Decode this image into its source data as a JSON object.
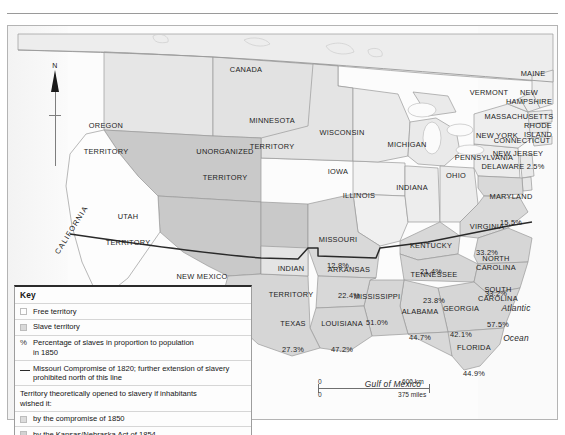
{
  "map": {
    "title": "Slave and free territories of the United States, 1850",
    "frame_color": "#b4b4b4",
    "background": "#fbfbfb",
    "north_arrow_label": "N",
    "colors": {
      "free_territory": "#fefefe",
      "slave_territory": "#d9d9d9",
      "unorganized": "#dedede",
      "compromise_1850": "#c9c9c9",
      "kansas_nebraska": "#d2d2d2",
      "water": "#f4f4f4",
      "compromise_line": "#2a2a2a",
      "border": "#9a9a9a"
    }
  },
  "oceans": [
    {
      "name": "Pacific Ocean",
      "line1": "Pacific",
      "line2": "Ocean"
    },
    {
      "name": "Atlantic Ocean",
      "line1": "Atlantic",
      "line2": "Ocean"
    },
    {
      "name": "Gulf of Mexico",
      "line1": "Gulf of Mexico",
      "line2": ""
    }
  ],
  "foreign": [
    {
      "name": "Canada",
      "label": "CANADA"
    }
  ],
  "territories": [
    {
      "name": "Oregon Territory",
      "line1": "OREGON",
      "line2": "TERRITORY"
    },
    {
      "name": "Utah Territory",
      "line1": "UTAH",
      "line2": "TERRITORY"
    },
    {
      "name": "New Mexico Territory",
      "line1": "NEW MEXICO",
      "line2": "TERRITORY"
    },
    {
      "name": "Unorganized Territory",
      "line1": "UNORGANIZED",
      "line2": "TERRITORY"
    },
    {
      "name": "Minnesota Territory",
      "line1": "MINNESOTA",
      "line2": "TERRITORY"
    },
    {
      "name": "Indian Territory",
      "line1": "INDIAN",
      "line2": "TERRITORY"
    }
  ],
  "states": [
    {
      "name": "California",
      "label": "CALIFORNIA",
      "pct": ""
    },
    {
      "name": "Wisconsin",
      "label": "WISCONSIN",
      "pct": ""
    },
    {
      "name": "Iowa",
      "label": "IOWA",
      "pct": ""
    },
    {
      "name": "Illinois",
      "label": "ILLINOIS",
      "pct": ""
    },
    {
      "name": "Michigan",
      "label": "MICHIGAN",
      "pct": ""
    },
    {
      "name": "Indiana",
      "label": "INDIANA",
      "pct": ""
    },
    {
      "name": "Ohio",
      "label": "OHIO",
      "pct": ""
    },
    {
      "name": "Pennsylvania",
      "label": "PENNSYLVANIA",
      "pct": ""
    },
    {
      "name": "New York",
      "label": "NEW YORK",
      "pct": ""
    },
    {
      "name": "Vermont",
      "label": "VERMONT",
      "pct": ""
    },
    {
      "name": "Maine",
      "label": "MAINE",
      "pct": ""
    },
    {
      "name": "New Hampshire",
      "label": "NEW\nHAMPSHIRE",
      "pct": ""
    },
    {
      "name": "Massachusetts",
      "label": "MASSACHUSETTS",
      "pct": ""
    },
    {
      "name": "Rhode Island",
      "label": "RHODE\nISLAND",
      "pct": ""
    },
    {
      "name": "Connecticut",
      "label": "CONNECTICUT",
      "pct": ""
    },
    {
      "name": "New Jersey",
      "label": "NEW JERSEY",
      "pct": ""
    },
    {
      "name": "Delaware",
      "label": "DELAWARE 2.5%",
      "pct": "2.5%"
    },
    {
      "name": "Maryland",
      "label": "MARYLAND",
      "pct": "15.5%"
    },
    {
      "name": "Virginia",
      "label": "VIRGINIA",
      "pct": "33.2%"
    },
    {
      "name": "Kentucky",
      "label": "KENTUCKY",
      "pct": "21.4%"
    },
    {
      "name": "Missouri",
      "label": "MISSOURI",
      "pct": "12.8%"
    },
    {
      "name": "Tennessee",
      "label": "TENNESSEE",
      "pct": "23.8%"
    },
    {
      "name": "North Carolina",
      "label": "NORTH\nCAROLINA",
      "pct": "33.2%"
    },
    {
      "name": "South Carolina",
      "label": "SOUTH\nCAROLINA",
      "pct": "57.5%"
    },
    {
      "name": "Georgia",
      "label": "GEORGIA",
      "pct": "42.1%"
    },
    {
      "name": "Alabama",
      "label": "ALABAMA",
      "pct": "44.7%"
    },
    {
      "name": "Mississippi",
      "label": "MISSISSIPPI",
      "pct": "51.0%"
    },
    {
      "name": "Arkansas",
      "label": "ARKANSAS",
      "pct": "22.4%"
    },
    {
      "name": "Louisiana",
      "label": "LOUISIANA",
      "pct": "47.2%"
    },
    {
      "name": "Texas",
      "label": "TEXAS",
      "pct": "27.3%"
    },
    {
      "name": "Florida",
      "label": "FLORIDA",
      "pct": "44.9%"
    }
  ],
  "legend": {
    "title": "Key",
    "free": "Free territory",
    "slave": "Slave territory",
    "pct_symbol": "%",
    "pct_line1": "Percentage of slaves in proportion to population",
    "pct_line2": "in 1850",
    "compromise_line1": "Missouri Compromise of 1820; further extension of slavery",
    "compromise_line2": "prohibited north of this line",
    "opened_line1": "Territory theoretically opened to slavery if  inhabitants",
    "opened_line2": "wished it:",
    "by_compromise_1850": "by the compromise of 1850",
    "by_kansas_nebraska": "by the Kansas/Nebraska Act of 1854"
  },
  "scale": {
    "km_start": "0",
    "km_end": "600 km",
    "mi_start": "0",
    "mi_end": "375 miles"
  }
}
